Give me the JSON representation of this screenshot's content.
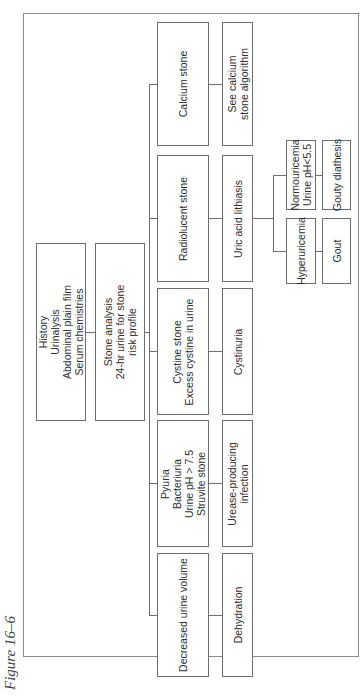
{
  "caption": "Figure 16–6",
  "nodes": {
    "initial": "History\nUrinalysis\nAbdominal plain film\nSerum chemistries",
    "analysis": "Stone analysis\n24-hr urine for stone\nrisk profile",
    "calcium_stone": "Calcium stone",
    "see_calcium": "See calcium\nstone algorithm",
    "radiolucent": "Radiolucent stone",
    "uric_acid": "Uric acid lithiasis",
    "hyperuricemia": "Hyperuricemia",
    "normouricemia": "Normouricemia\nUrine pH<5.5",
    "gout": "Gout",
    "gouty_diathesis": "Gouty diathesis",
    "cystine_stone": "Cystine stone\nExcess cystine in urine",
    "cystinuria": "Cystinuria",
    "struvite": "Pyuria\nBacteriuria\nUrine pH > 7.5\nStruvite stone",
    "urease": "Urease-producing\ninfection",
    "decreased_volume": "Decreased urine volume",
    "dehydration": "Dehydration"
  }
}
